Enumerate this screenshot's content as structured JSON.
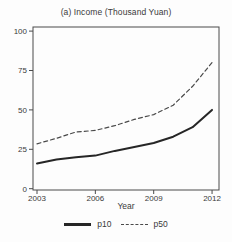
{
  "panel": {
    "background": "#fdfdfd"
  },
  "chart_data": {
    "type": "line",
    "title": "(a) Income (Thousand Yuan)",
    "xlabel": "Year",
    "ylabel": "",
    "x": [
      2003,
      2004,
      2005,
      2006,
      2007,
      2008,
      2009,
      2010,
      2011,
      2012
    ],
    "series": [
      {
        "name": "p10",
        "style": "solid",
        "color": "#262626",
        "values": [
          16,
          18.5,
          20,
          21,
          24,
          26.5,
          29,
          33,
          39,
          50
        ]
      },
      {
        "name": "p50",
        "style": "dashed",
        "color": "#4a4a4a",
        "values": [
          28.5,
          32,
          36,
          37,
          40,
          44,
          47,
          53,
          65,
          80
        ]
      }
    ],
    "xticks": [
      2003,
      2006,
      2009,
      2012
    ],
    "yticks": [
      0,
      25,
      50,
      75,
      100
    ],
    "xlim": [
      2002.8,
      2012.4
    ],
    "ylim": [
      0,
      100
    ],
    "grid": false,
    "legend_position": "bottom",
    "axis_color": "#4a4a4a",
    "text_color": "#3a3a3a"
  }
}
